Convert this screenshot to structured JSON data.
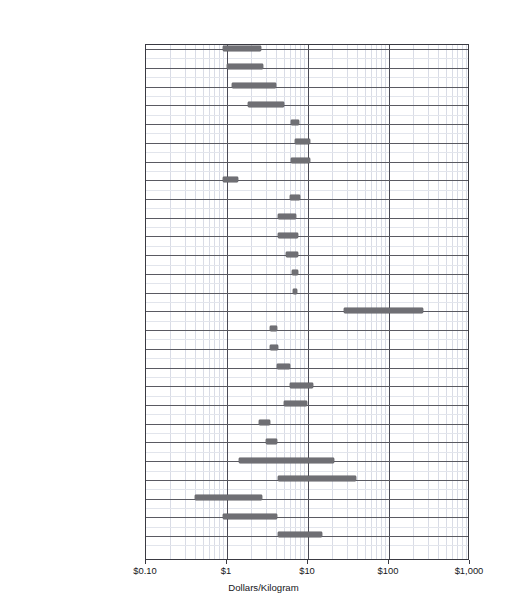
{
  "chart_data": {
    "type": "bar",
    "orientation": "horizontal-range",
    "title": "",
    "xlabel": "Dollars/Kilogram",
    "ylabel": "",
    "xscale": "log",
    "xlim": [
      0.1,
      1000
    ],
    "xticks": [
      0.1,
      1,
      10,
      100,
      1000
    ],
    "xticklabels": [
      "$0.10",
      "$1",
      "$10",
      "$100",
      "$1,000"
    ],
    "grid": true,
    "legend": "none",
    "categories": [
      "1020 Steel",
      "1040 Steel",
      "4140 Steel",
      "4340 Steel",
      "S304 Stainless Steel",
      "S316 Stainless Steel",
      "01 Tool Steel",
      "Gray Cast Iron",
      "2024 Aluminum",
      "3003 or 5005 Aluminum",
      "6061 Aluminum",
      "7075 Aluminum",
      "70/30 Brass",
      "#110 Copper Alloy",
      "Titanium 6-4",
      "Magnesium AZ91D",
      "ABS",
      "Polycarbonate (PC)",
      "Nylon 6/6",
      "Polypropylene (PP)",
      "Polystyrene (PS)",
      "Alumina Ceramic",
      "Graphite (Graphitezed Carbon)",
      "Douglas Fir/Pine",
      "Oak",
      "Fiberglass/Epoxy",
      "Graphite/Epoxy"
    ],
    "ranges": [
      {
        "category": "1020 Steel",
        "low": 0.9,
        "high": 2.6
      },
      {
        "category": "1040 Steel",
        "low": 1.0,
        "high": 2.8
      },
      {
        "category": "4140 Steel",
        "low": 1.15,
        "high": 4.0
      },
      {
        "category": "4340 Steel",
        "low": 1.8,
        "high": 5.1
      },
      {
        "category": "S304 Stainless Steel",
        "low": 6.2,
        "high": 7.8
      },
      {
        "category": "S316 Stainless Steel",
        "low": 7.0,
        "high": 10.5
      },
      {
        "category": "01 Tool Steel",
        "low": 6.2,
        "high": 10.5
      },
      {
        "category": "Gray Cast Iron",
        "low": 0.88,
        "high": 1.35
      },
      {
        "category": "2024 Aluminum",
        "low": 6.0,
        "high": 8.0
      },
      {
        "category": "3003 or 5005 Aluminum",
        "low": 4.3,
        "high": 7.2
      },
      {
        "category": "6061 Aluminum",
        "low": 4.3,
        "high": 7.6
      },
      {
        "category": "7075 Aluminum",
        "low": 5.3,
        "high": 7.6
      },
      {
        "category": "70/30 Brass",
        "low": 6.4,
        "high": 7.6
      },
      {
        "category": "#110 Copper Alloy",
        "low": 6.6,
        "high": 7.4
      },
      {
        "category": "Titanium 6-4",
        "low": 28.0,
        "high": 260.0
      },
      {
        "category": "Magnesium AZ91D",
        "low": 3.4,
        "high": 4.1
      },
      {
        "category": "ABS",
        "low": 3.4,
        "high": 4.3
      },
      {
        "category": "Polycarbonate (PC)",
        "low": 4.1,
        "high": 6.0
      },
      {
        "category": "Nylon 6/6",
        "low": 6.0,
        "high": 11.5
      },
      {
        "category": "Polypropylene (PP)",
        "low": 5.0,
        "high": 9.6
      },
      {
        "category": "Polystyrene (PS)",
        "low": 2.5,
        "high": 3.4
      },
      {
        "category": "Alumina Ceramic",
        "low": 3.0,
        "high": 4.1
      },
      {
        "category": "Graphite (Graphitezed Carbon)",
        "low": 1.4,
        "high": 21.0
      },
      {
        "category": "Douglas Fir/Pine",
        "low": 4.3,
        "high": 39.0
      },
      {
        "category": "Oak",
        "low": 0.4,
        "high": 2.7
      },
      {
        "category": "Fiberglass/Epoxy",
        "low": 0.88,
        "high": 4.1
      },
      {
        "category": "Graphite/Epoxy",
        "low": 4.3,
        "high": 15.0
      }
    ]
  },
  "axis": {
    "x_title": "Dollars/Kilogram",
    "tick_labels": [
      "$0.10",
      "$1",
      "$10",
      "$100",
      "$1,000"
    ]
  },
  "colors": {
    "bar": "#6f6f74",
    "grid_major": "#4a4a55",
    "grid_minor": "#d9dce6",
    "row_line": "#5a5a62",
    "axis": "#3a3a42",
    "text": "#16161a",
    "background": "#ffffff"
  }
}
